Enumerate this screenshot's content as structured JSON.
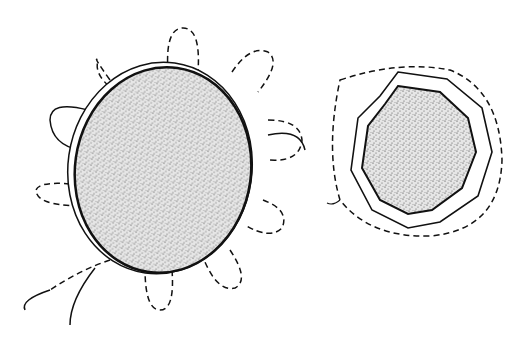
{
  "figure": {
    "left_patch": {
      "loops": 10,
      "notches": 10
    },
    "right_patch": {
      "sides": 10
    },
    "colors": {
      "ink": "#111111",
      "stipple": "#555555",
      "background": "#ffffff"
    }
  }
}
